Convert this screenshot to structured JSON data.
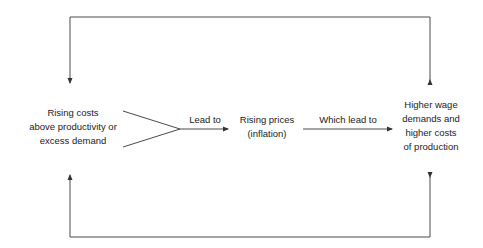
{
  "diagram": {
    "colors": {
      "line": "#4a4a4a",
      "text": "#222222",
      "background": "#ffffff"
    },
    "nodes": {
      "cause": {
        "lines": [
          "Rising costs",
          "above productivity or",
          "excess demand"
        ]
      },
      "prices": {
        "lines": [
          "Rising prices",
          "(inflation)"
        ]
      },
      "wages": {
        "lines": [
          "Higher wage",
          "demands and",
          "higher costs",
          "of production"
        ]
      }
    },
    "edges": {
      "cause_to_prices": {
        "label": "Lead to"
      },
      "prices_to_wages": {
        "label": "Which lead to"
      },
      "top_loop": {
        "label": ""
      },
      "bottom_loop": {
        "label": ""
      }
    }
  }
}
